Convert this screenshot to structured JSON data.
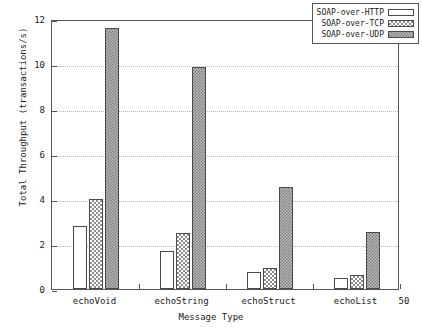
{
  "chart_data": {
    "type": "bar",
    "title": "",
    "xlabel": "Message Type",
    "ylabel": "Total Throughput (transactions/s)",
    "categories": [
      "echoVoid",
      "echoString",
      "echoStruct",
      "echoList"
    ],
    "series": [
      {
        "name": "SOAP-over-HTTP",
        "values": [
          2.8,
          1.7,
          0.75,
          0.5
        ],
        "fill": "white"
      },
      {
        "name": "SOAP-over-TCP",
        "values": [
          4.0,
          2.5,
          0.95,
          0.62
        ],
        "fill": "crosshatch"
      },
      {
        "name": "SOAP-over-UDP",
        "values": [
          11.6,
          9.85,
          4.55,
          2.55
        ],
        "fill": "dense-dots"
      }
    ],
    "ylim": [
      0,
      12
    ],
    "yticks": [
      0,
      2,
      4,
      6,
      8,
      10,
      12
    ],
    "ytick_labels": [
      "0",
      "2",
      "4",
      "6",
      "8",
      "10",
      "12"
    ],
    "grid": true,
    "grid_style": "dotted-horizontal",
    "legend_position": "top-right",
    "corner_label": "50"
  },
  "legend": {
    "entries": [
      {
        "label": "SOAP-over-HTTP"
      },
      {
        "label": "SOAP-over-TCP"
      },
      {
        "label": "SOAP-over-UDP"
      }
    ]
  },
  "axes": {
    "x_title": "Message Type",
    "y_title": "Total Throughput (transactions/s)"
  }
}
